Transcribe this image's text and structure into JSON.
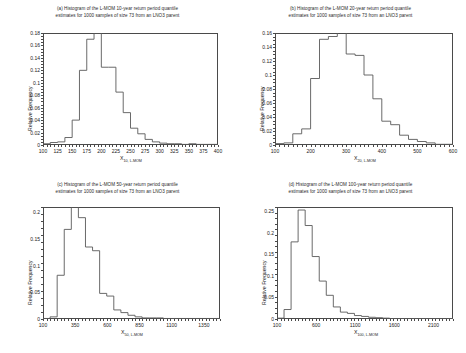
{
  "figure": {
    "y_axis_label": "Relative Frequency",
    "panel_count": 4
  },
  "chart_data": [
    {
      "id": "panel-a",
      "type": "bar",
      "title": "(a) Histogram of  the L-MOM 10-year return period quantile estimates for 1000 samples of size 73 from an LNO3 parent",
      "title_line1": "(a) Histogram of  the L-MOM 10-year return period quantile",
      "title_line2": "estimates for 1000 samples of size 73 from an LNO3 parent",
      "xlabel_base": "X",
      "xlabel_sub": "10, L-MOM",
      "ylabel": "Relative Frequency",
      "xlim": [
        100,
        400
      ],
      "ylim": [
        0,
        0.18
      ],
      "xticks": [
        100,
        125,
        150,
        175,
        200,
        225,
        250,
        275,
        300,
        325,
        350,
        375,
        400
      ],
      "yticks": [
        0,
        0.02,
        0.04,
        0.06,
        0.08,
        0.1,
        0.12,
        0.14,
        0.16,
        0.18
      ],
      "bin_width": 12.5,
      "bin_edges": [
        100,
        112.5,
        125,
        137.5,
        150,
        162.5,
        175,
        187.5,
        200,
        212.5,
        225,
        237.5,
        250,
        262.5,
        275,
        287.5,
        300,
        312.5,
        325,
        337.5,
        350,
        362.5,
        375,
        387.5,
        400
      ],
      "values": [
        0.002,
        0.004,
        0.005,
        0.012,
        0.04,
        0.12,
        0.17,
        0.18,
        0.125,
        0.125,
        0.085,
        0.052,
        0.027,
        0.018,
        0.009,
        0.005,
        0.003,
        0.002,
        0.002,
        0.001,
        0.002,
        0.001,
        0.001,
        0.001
      ],
      "grid": false,
      "legend": "none"
    },
    {
      "id": "panel-b",
      "type": "bar",
      "title": "(b) Histogram of the L-MOM 20-year return period quantile estimates for 1000 samples of size 73 from an LNO3 parent",
      "title_line1": "(b) Histogram of  the L-MOM 20-year return period quantile",
      "title_line2": "estimates for 1000 samples of size 73 from an LNO3 parent",
      "xlabel_base": "X",
      "xlabel_sub": "20, L-MOM",
      "ylabel": "Relative Frequency",
      "xlim": [
        100,
        600
      ],
      "ylim": [
        0,
        0.16
      ],
      "xticks": [
        100,
        200,
        300,
        400,
        500,
        600
      ],
      "yticks": [
        0,
        0.02,
        0.04,
        0.06,
        0.08,
        0.1,
        0.12,
        0.14,
        0.16
      ],
      "bin_width": 25,
      "bin_edges": [
        100,
        125,
        150,
        175,
        200,
        225,
        250,
        275,
        300,
        325,
        350,
        375,
        400,
        425,
        450,
        475,
        500,
        525,
        550,
        575,
        600
      ],
      "values": [
        0.002,
        0.003,
        0.016,
        0.023,
        0.095,
        0.151,
        0.155,
        0.161,
        0.13,
        0.128,
        0.1,
        0.066,
        0.034,
        0.029,
        0.014,
        0.008,
        0.005,
        0.003,
        0.001,
        0.001
      ],
      "grid": false,
      "legend": "none"
    },
    {
      "id": "panel-c",
      "type": "bar",
      "title": "(c) Histogram of  the L-MOM 50-year return period quantile estimates for 1000 samples of size 73 from an LNO3 parent",
      "title_line1": "(c) Histogram of  the L-MOM 50-year return period quantile",
      "title_line2": "estimates for 1000 samples of size 73 from an LNO3 parent",
      "xlabel_base": "X",
      "xlabel_sub": "50, L-MOM",
      "ylabel": "Relative Frequency",
      "xlim": [
        100,
        1475
      ],
      "ylim": [
        0,
        0.21
      ],
      "xticks": [
        100,
        350,
        600,
        850,
        1100,
        1350
      ],
      "yticks": [
        0,
        0.05,
        0.1,
        0.15,
        0.2
      ],
      "bin_width": 55,
      "bin_edges": [
        100,
        155,
        210,
        265,
        320,
        375,
        430,
        485,
        540,
        595,
        650,
        705,
        760,
        815,
        870,
        925,
        980,
        1035,
        1090,
        1145,
        1200,
        1255,
        1310,
        1365,
        1420,
        1475
      ],
      "values": [
        0.001,
        0.004,
        0.082,
        0.168,
        0.21,
        0.19,
        0.135,
        0.128,
        0.048,
        0.043,
        0.017,
        0.012,
        0.007,
        0.004,
        0.002,
        0.002,
        0.002,
        0.001,
        0.001,
        0.001,
        0.001,
        0.001,
        0.001,
        0.001,
        0.001
      ],
      "grid": false,
      "legend": "none"
    },
    {
      "id": "panel-d",
      "type": "bar",
      "title": "(d) Histogram of  the L-MOM 100-year return period quantile estimates for 1000 samples of size 73 from an LNO3 parent",
      "title_line1": "(d) Histogram of  the L-MOM 100-year return period quantile",
      "title_line2": "estimates for 1000 samples of size 73 from an LNO3 parent",
      "xlabel_base": "X",
      "xlabel_sub": "100, L-MOM",
      "ylabel": "Relative Frequency",
      "xlim": [
        100,
        2350
      ],
      "ylim": [
        0,
        0.26
      ],
      "xticks": [
        100,
        600,
        1100,
        1600,
        2100
      ],
      "yticks": [
        0,
        0.05,
        0.1,
        0.15,
        0.2,
        0.25
      ],
      "bin_width": 90,
      "bin_edges": [
        100,
        190,
        280,
        370,
        460,
        550,
        640,
        730,
        820,
        910,
        1000,
        1090,
        1180,
        1270,
        1360,
        1450,
        1540,
        1630,
        1720,
        1810,
        1900,
        1990,
        2080,
        2170,
        2260,
        2350
      ],
      "values": [
        0.002,
        0.022,
        0.179,
        0.253,
        0.217,
        0.145,
        0.088,
        0.055,
        0.028,
        0.016,
        0.013,
        0.008,
        0.006,
        0.004,
        0.003,
        0.002,
        0.001,
        0.001,
        0.001,
        0.001,
        0.001,
        0.001,
        0.001,
        0.001,
        0.001
      ],
      "grid": false,
      "legend": "none"
    }
  ]
}
